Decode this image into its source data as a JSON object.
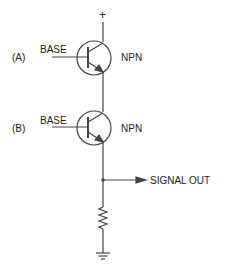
{
  "diagram": {
    "title": "",
    "supply_label": "+",
    "transistors": [
      {
        "id": "A",
        "tag": "(A)",
        "base_label": "BASE",
        "type_label": "NPN"
      },
      {
        "id": "B",
        "tag": "(B)",
        "base_label": "BASE",
        "type_label": "NPN"
      }
    ],
    "output_label": "SIGNAL OUT",
    "components": [
      "npn-transistor",
      "npn-transistor",
      "resistor",
      "ground"
    ],
    "line_color": "#333333"
  }
}
